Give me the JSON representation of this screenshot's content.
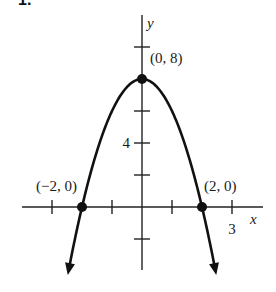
{
  "problem_label_partial": "1.",
  "chart_data": {
    "type": "line",
    "title": "",
    "function": "y = 8 - 2x^2",
    "xlabel": "x",
    "ylabel": "y",
    "x_ticks": [
      -3,
      -1,
      1,
      3
    ],
    "x_tick_labels": [
      {
        "x": 3,
        "label": "3"
      }
    ],
    "y_ticks": [
      10,
      6,
      4,
      2,
      -2
    ],
    "y_tick_labels": [
      {
        "y": 4,
        "label": "4"
      }
    ],
    "labeled_points": [
      {
        "x": 0,
        "y": 8,
        "label": "(0, 8)"
      },
      {
        "x": -2,
        "y": 0,
        "label": "(−2, 0)"
      },
      {
        "x": 2,
        "y": 0,
        "label": "(2, 0)"
      }
    ],
    "xlim": [
      -4,
      4
    ],
    "ylim": [
      -4,
      12
    ],
    "curve_x_range": [
      -2.45,
      2.45
    ],
    "arrows_at_ends": true,
    "grid": false,
    "legend": false,
    "colors": {
      "curve": "#111111",
      "axis": "#222222",
      "background": "#ffffff"
    }
  }
}
